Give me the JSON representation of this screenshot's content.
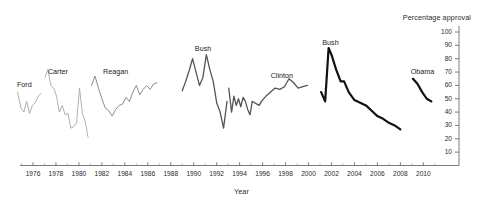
{
  "chart_data": {
    "type": "line",
    "title": "",
    "xlabel": "Year",
    "ylabel": "Percentage approval",
    "xlim": [
      1974,
      2011.5
    ],
    "ylim": [
      0,
      100
    ],
    "grid": false,
    "legend_position": "inline-annotations",
    "y_ticks": [
      10,
      20,
      30,
      40,
      50,
      60,
      70,
      80,
      90,
      100
    ],
    "y_tick_labels": [
      "10",
      "20",
      "30",
      "40",
      "50",
      "60",
      "70",
      "80",
      "90",
      "100"
    ],
    "y_axis_side": "right",
    "x_ticks": [
      1976,
      1978,
      1980,
      1982,
      1984,
      1986,
      1988,
      1990,
      1992,
      1994,
      1996,
      1998,
      2000,
      2002,
      2004,
      2006,
      2008,
      2010
    ],
    "x_tick_labels": [
      "1976",
      "1978",
      "1980",
      "1982",
      "1984",
      "1986",
      "1988",
      "1990",
      "1992",
      "1994",
      "1996",
      "1998",
      "2000",
      "2002",
      "2004",
      "2006",
      "2008",
      "2010"
    ],
    "x_minor_ticks": [
      1975,
      1977,
      1979,
      1981,
      1983,
      1985,
      1987,
      1989,
      1991,
      1993,
      1995,
      1997,
      1999,
      2001,
      2003,
      2005,
      2007,
      2009,
      2011
    ],
    "series": [
      {
        "name": "Ford",
        "label": "Ford",
        "color": "#a8a8a8",
        "width": 0.9,
        "label_x": 1974.6,
        "label_y": 60.5,
        "x": [
          1974.65,
          1974.95,
          1975.2,
          1975.45,
          1975.7,
          1975.95,
          1976.2,
          1976.45,
          1976.7
        ],
        "y": [
          55,
          43,
          40,
          48,
          39,
          45,
          47,
          52,
          54
        ]
      },
      {
        "name": "Carter",
        "label": "Carter",
        "color": "#a8a8a8",
        "width": 0.9,
        "label_x": 1977.3,
        "label_y": 70,
        "x": [
          1977.05,
          1977.3,
          1977.55,
          1977.8,
          1978.05,
          1978.3,
          1978.55,
          1978.8,
          1979.05,
          1979.3,
          1979.55,
          1979.8,
          1980.05,
          1980.3,
          1980.55,
          1980.8
        ],
        "y": [
          66,
          72,
          60,
          58,
          52,
          40,
          45,
          38,
          39,
          28,
          29,
          32,
          58,
          39,
          33,
          21
        ]
      },
      {
        "name": "Reagan",
        "label": "Reagan",
        "color": "#8d8d8d",
        "width": 1.0,
        "label_x": 1982.1,
        "label_y": 70,
        "x": [
          1981.1,
          1981.4,
          1981.7,
          1982.0,
          1982.3,
          1982.6,
          1982.9,
          1983.2,
          1983.5,
          1983.8,
          1984.1,
          1984.4,
          1984.7,
          1985.0,
          1985.3,
          1985.6,
          1985.9,
          1986.2,
          1986.5,
          1986.8
        ],
        "y": [
          60,
          67,
          58,
          50,
          43,
          41,
          37,
          42,
          45,
          46,
          51,
          48,
          55,
          60,
          53,
          57,
          60,
          57,
          61,
          62
        ]
      },
      {
        "name": "Bush",
        "label": "Bush",
        "color": "#545454",
        "width": 1.3,
        "label_x": 1990.1,
        "label_y": 87,
        "x": [
          1989.0,
          1989.3,
          1989.6,
          1989.9,
          1990.2,
          1990.5,
          1990.8,
          1991.1,
          1991.4,
          1991.7,
          1992.0,
          1992.3,
          1992.6,
          1992.9
        ],
        "y": [
          56,
          63,
          71,
          80,
          70,
          60,
          66,
          83,
          72,
          63,
          47,
          40,
          28,
          48
        ]
      },
      {
        "name": "Clinton",
        "label": "Clinton",
        "color": "#545454",
        "width": 1.3,
        "label_x": 1996.7,
        "label_y": 67,
        "x": [
          1993.05,
          1993.3,
          1993.5,
          1993.7,
          1993.9,
          1994.1,
          1994.3,
          1994.5,
          1994.7,
          1994.9,
          1995.1,
          1995.3,
          1995.5,
          1995.7,
          1995.9,
          1996.3,
          1996.7,
          1997.1,
          1997.5,
          1997.9,
          1998.3,
          1998.7,
          1999.1,
          1999.5,
          1999.9
        ],
        "y": [
          58,
          40,
          52,
          45,
          50,
          44,
          51,
          48,
          42,
          38,
          48,
          47,
          46,
          45,
          48,
          52,
          55,
          58,
          57,
          59,
          65,
          62,
          58,
          59,
          60
        ]
      },
      {
        "name": "Bush",
        "label": "Bush",
        "color": "#111111",
        "width": 2.2,
        "label_x": 2001.2,
        "label_y": 92,
        "x": [
          2001.1,
          2001.45,
          2001.75,
          2002.0,
          2002.4,
          2002.8,
          2003.1,
          2003.5,
          2004.0,
          2004.5,
          2005.0,
          2005.5,
          2006.0,
          2006.5,
          2007.0,
          2007.5,
          2008.0
        ],
        "y": [
          55,
          48,
          88,
          83,
          72,
          63,
          63,
          55,
          49,
          47,
          45,
          41,
          37,
          35,
          32,
          30,
          27
        ]
      },
      {
        "name": "Obama",
        "label": "Obama",
        "color": "#111111",
        "width": 2.2,
        "label_x": 2008.9,
        "label_y": 70,
        "x": [
          2009.1,
          2009.5,
          2009.9,
          2010.3,
          2010.7
        ],
        "y": [
          65,
          61,
          55,
          50,
          48
        ]
      }
    ]
  }
}
